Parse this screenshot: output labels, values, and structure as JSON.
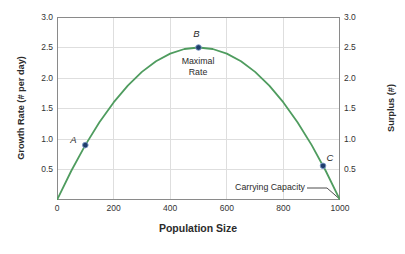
{
  "chart_data": {
    "type": "line",
    "title": "",
    "xlabel": "Population Size",
    "ylabel_left": "Growth Rate (# per day)",
    "ylabel_right": "Surplus (#)",
    "xlim": [
      0,
      1000
    ],
    "ylim": [
      0,
      3.0
    ],
    "x_ticks": [
      0,
      200,
      400,
      600,
      800,
      1000
    ],
    "y_ticks": [
      0.5,
      1.0,
      1.5,
      2.0,
      2.5,
      3.0
    ],
    "grid": true,
    "legend": false,
    "series": [
      {
        "name": "logistic growth rate curve",
        "color": "#4f9c5f",
        "x": [
          0,
          50,
          100,
          150,
          200,
          250,
          300,
          350,
          400,
          450,
          500,
          550,
          600,
          650,
          700,
          750,
          800,
          850,
          900,
          950,
          1000
        ],
        "y": [
          0,
          0.475,
          0.9,
          1.275,
          1.6,
          1.875,
          2.1,
          2.275,
          2.4,
          2.475,
          2.5,
          2.475,
          2.4,
          2.275,
          2.1,
          1.875,
          1.6,
          1.275,
          0.9,
          0.475,
          0
        ]
      }
    ],
    "points": [
      {
        "label": "A",
        "x": 100,
        "y": 0.9
      },
      {
        "label": "B",
        "x": 500,
        "y": 2.5
      },
      {
        "label": "C",
        "x": 940,
        "y": 0.56
      }
    ],
    "annotations": [
      {
        "text": "Maximal Rate",
        "attached_to_point": "B"
      },
      {
        "text": "Carrying Capacity",
        "points_to": {
          "x": 1000,
          "y": 0
        }
      }
    ]
  },
  "colors": {
    "curve": "#4f9c5f",
    "point_fill": "#1e3d6b",
    "point_ring": "#7b97c4",
    "grid": "#dedede",
    "axis_frame": "#8a8a8a",
    "text": "#2b2b2b",
    "leader_line": "#4d4d4d",
    "background": "#ffffff"
  }
}
